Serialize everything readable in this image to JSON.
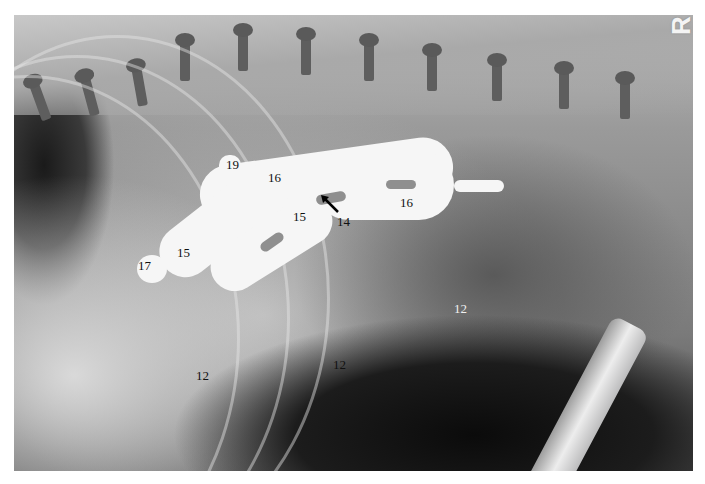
{
  "image": {
    "type": "radiograph",
    "view": "lateral abdominal/thoracic radiograph with positive-contrast GI study",
    "side_marker": "R"
  },
  "labels": [
    {
      "id": "label-19",
      "text": "19",
      "x": 226,
      "y": 158,
      "color": "dark"
    },
    {
      "id": "label-16-a",
      "text": "16",
      "x": 268,
      "y": 171,
      "color": "dark"
    },
    {
      "id": "label-16-b",
      "text": "16",
      "x": 400,
      "y": 196,
      "color": "dark"
    },
    {
      "id": "label-15-a",
      "text": "15",
      "x": 293,
      "y": 210,
      "color": "dark"
    },
    {
      "id": "label-15-b",
      "text": "15",
      "x": 177,
      "y": 246,
      "color": "dark"
    },
    {
      "id": "label-14",
      "text": "14",
      "x": 337,
      "y": 215,
      "color": "dark"
    },
    {
      "id": "label-17",
      "text": "17",
      "x": 138,
      "y": 259,
      "color": "dark"
    },
    {
      "id": "label-12-a",
      "text": "12",
      "x": 454,
      "y": 302,
      "color": "light"
    },
    {
      "id": "label-12-b",
      "text": "12",
      "x": 333,
      "y": 358,
      "color": "dark"
    },
    {
      "id": "label-12-c",
      "text": "12",
      "x": 196,
      "y": 369,
      "color": "dark"
    }
  ],
  "annotations": {
    "arrow": {
      "points_to": "14",
      "direction": "up-left",
      "color": "#000000"
    }
  },
  "colors": {
    "contrast_medium": "#f6f6f6",
    "soft_tissue": "#8c8c8c",
    "gas": "#111111",
    "border": "#ffffff"
  }
}
